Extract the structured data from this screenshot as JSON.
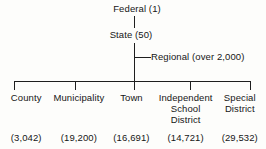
{
  "diagram": {
    "type": "hierarchy-tree",
    "top_levels": [
      {
        "id": "federal",
        "label": "Federal (1)",
        "name": "Federal",
        "count": "1"
      },
      {
        "id": "state",
        "label": "State (50)",
        "name": "State",
        "count": "50"
      },
      {
        "id": "regional",
        "label": "Regional (over 2,000)",
        "name": "Regional",
        "count": "over 2,000"
      }
    ],
    "local_levels": [
      {
        "id": "county",
        "title": "County",
        "count": "(3,042)"
      },
      {
        "id": "municipality",
        "title": "Municipality",
        "count": "(19,200)"
      },
      {
        "id": "town",
        "title": "Town",
        "count": "(16,691)"
      },
      {
        "id": "school",
        "title": "Independent\nSchool\nDistrict",
        "count": "(14,721)"
      },
      {
        "id": "special",
        "title": "Special\nDistrict",
        "count": "(29,532)"
      }
    ],
    "colors": {
      "line": "#1e1e1e",
      "text": "#161616",
      "background": "#fdfdfb"
    }
  }
}
